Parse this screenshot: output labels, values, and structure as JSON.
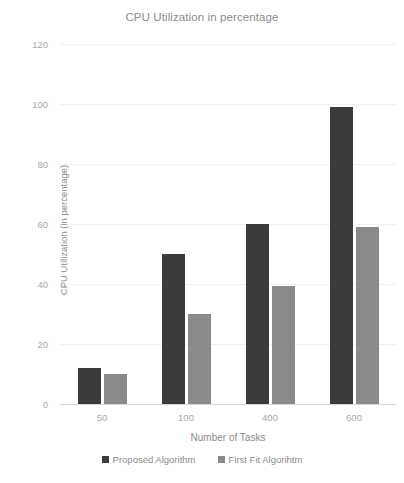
{
  "chart_data": {
    "type": "bar",
    "title": "CPU Utilization in percentage",
    "xlabel": "Number of Tasks",
    "ylabel": "CPU Utilization (in percentage)",
    "categories": [
      "50",
      "100",
      "400",
      "600"
    ],
    "series": [
      {
        "name": "Proposed Algorithm",
        "color": "#3b3b3b",
        "values": [
          12,
          50,
          60,
          99
        ]
      },
      {
        "name": "First Fit Algorihtm",
        "color": "#8a8a8a",
        "values": [
          10,
          30,
          39.5,
          59
        ]
      }
    ],
    "ylim": [
      0,
      120
    ],
    "yticks": [
      0,
      20,
      40,
      60,
      80,
      100,
      120
    ],
    "ytick_labels": [
      "0",
      "20",
      "40",
      "60",
      "80",
      "100",
      "120"
    ],
    "grid": "horizontal",
    "legend_position": "bottom-center"
  }
}
